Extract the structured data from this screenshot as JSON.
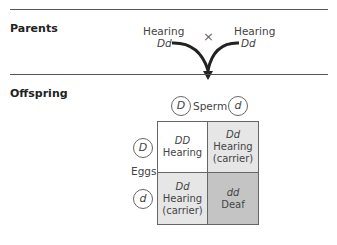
{
  "parents": {
    "label": "Parents",
    "left": {
      "phenotype": "Hearing",
      "genotype": "Dd"
    },
    "right": {
      "phenotype": "Hearing",
      "genotype": "Dd"
    },
    "cross_symbol": "×"
  },
  "offspring": {
    "label": "Offspring",
    "sperm_label": "Sperm",
    "sperm_alleles": [
      "D",
      "d"
    ],
    "eggs_label": "Eggs",
    "egg_alleles": [
      "D",
      "d"
    ],
    "cells": [
      {
        "genotype": "DD",
        "phenotype": "Hearing",
        "note": "",
        "color": "#ffffff"
      },
      {
        "genotype": "Dd",
        "phenotype": "Hearing",
        "note": "(carrier)",
        "color": "#e6e6e6"
      },
      {
        "genotype": "Dd",
        "phenotype": "Hearing",
        "note": "(carrier)",
        "color": "#e6e6e6"
      },
      {
        "genotype": "dd",
        "phenotype": "Deaf",
        "note": "",
        "color": "#c4c4c4"
      }
    ]
  }
}
